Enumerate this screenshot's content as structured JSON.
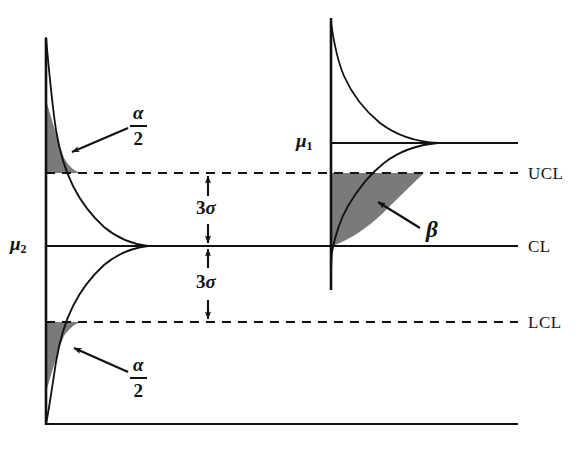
{
  "figure": {
    "background_color": "#ffffff",
    "line_color": "#111111",
    "shade_color": "#777777"
  },
  "axes": {
    "left_axis_name": "left-vertical-axis",
    "baseline_name": "horizontal-baseline",
    "right_axis_name": "right-vertical-axis"
  },
  "control_limits": [
    {
      "key": "ucl",
      "label": "UCL",
      "style": "dashed",
      "y": 173
    },
    {
      "key": "cl",
      "label": "CL",
      "style": "solid",
      "y": 246
    },
    {
      "key": "lcl",
      "label": "LCL",
      "style": "dashed",
      "y": 322
    }
  ],
  "distributions": {
    "in_control": {
      "mean_label": "μ",
      "mean_subscript": "2",
      "center_y": 246,
      "description": "in-control distribution centered on CL"
    },
    "shifted": {
      "mean_label": "μ",
      "mean_subscript": "1",
      "center_y": 143,
      "description": "shifted distribution centered above UCL"
    }
  },
  "annotations": {
    "alpha_upper": {
      "numerator": "α",
      "denominator": "2"
    },
    "alpha_lower": {
      "numerator": "α",
      "denominator": "2"
    },
    "beta": {
      "label": "β"
    },
    "sigma_upper": {
      "coefficient": "3",
      "symbol": "σ"
    },
    "sigma_lower": {
      "coefficient": "3",
      "symbol": "σ"
    }
  }
}
